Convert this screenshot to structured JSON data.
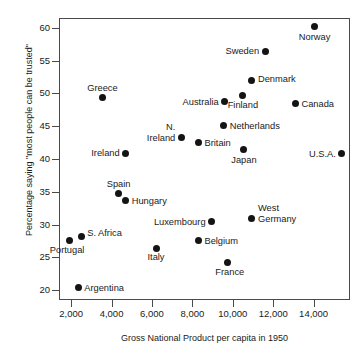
{
  "chart_data": {
    "type": "scatter",
    "title": "",
    "xlabel": "Gross National Product per capita in 1950",
    "ylabel": "Percentage saying \"most people can be trusted\"",
    "xlim": [
      1400,
      15800
    ],
    "ylim": [
      18.5,
      61.5
    ],
    "xticks": [
      "2,000",
      "4,000",
      "6,000",
      "8,000",
      "10,000",
      "12,000",
      "14,000"
    ],
    "xtick_values": [
      2000,
      4000,
      6000,
      8000,
      10000,
      12000,
      14000
    ],
    "yticks": [
      "20",
      "25",
      "30",
      "35",
      "40",
      "45",
      "50",
      "55",
      "60"
    ],
    "ytick_values": [
      20,
      25,
      30,
      35,
      40,
      45,
      50,
      55,
      60
    ],
    "grid": false,
    "legend": "none",
    "marker_color": "#141414",
    "points": [
      {
        "label": "Norway",
        "x": 14050,
        "y": 60.2,
        "pos": "b",
        "dx": 0,
        "dy": 5
      },
      {
        "label": "Sweden",
        "x": 11600,
        "y": 56.4,
        "pos": "l",
        "dx": -6,
        "dy": 0
      },
      {
        "label": "Denmark",
        "x": 10950,
        "y": 52.0,
        "pos": "r",
        "dx": 6,
        "dy": -1
      },
      {
        "label": "Finland",
        "x": 10500,
        "y": 49.7,
        "pos": "b",
        "dx": 0,
        "dy": 5
      },
      {
        "label": "Greece",
        "x": 3550,
        "y": 49.4,
        "pos": "t",
        "dx": 0,
        "dy": -4
      },
      {
        "label": "Australia",
        "x": 9600,
        "y": 48.7,
        "pos": "l",
        "dx": -6,
        "dy": 0
      },
      {
        "label": "Canada",
        "x": 13100,
        "y": 48.4,
        "pos": "r",
        "dx": 6,
        "dy": 0
      },
      {
        "label": "Netherlands",
        "x": 9550,
        "y": 45.1,
        "pos": "r",
        "dx": 6,
        "dy": 0
      },
      {
        "label": "N.\nIreland",
        "x": 7450,
        "y": 43.3,
        "pos": "l",
        "dx": -6,
        "dy": -5
      },
      {
        "label": "Britain",
        "x": 8300,
        "y": 42.5,
        "pos": "r",
        "dx": 6,
        "dy": 0
      },
      {
        "label": "Japan",
        "x": 10550,
        "y": 41.4,
        "pos": "b",
        "dx": 0,
        "dy": 5
      },
      {
        "label": "U.S.A.",
        "x": 15400,
        "y": 40.8,
        "pos": "l",
        "dx": -6,
        "dy": 0
      },
      {
        "label": "Ireland",
        "x": 4700,
        "y": 40.9,
        "pos": "l",
        "dx": -6,
        "dy": 0
      },
      {
        "label": "Spain",
        "x": 4350,
        "y": 34.8,
        "pos": "t",
        "dx": 0,
        "dy": -4
      },
      {
        "label": "Hungary",
        "x": 4700,
        "y": 33.7,
        "pos": "r",
        "dx": 6,
        "dy": 1
      },
      {
        "label": "West\nGermany",
        "x": 10950,
        "y": 31.0,
        "pos": "r",
        "dx": 6,
        "dy": -5
      },
      {
        "label": "Luxembourg",
        "x": 8950,
        "y": 30.4,
        "pos": "l",
        "dx": -6,
        "dy": 0
      },
      {
        "label": "S. Africa",
        "x": 2500,
        "y": 28.2,
        "pos": "r",
        "dx": 6,
        "dy": -3
      },
      {
        "label": "Portugal",
        "x": 1900,
        "y": 27.5,
        "pos": "b",
        "dx": -2,
        "dy": 4
      },
      {
        "label": "Belgium",
        "x": 8300,
        "y": 27.5,
        "pos": "r",
        "dx": 6,
        "dy": 0
      },
      {
        "label": "Italy",
        "x": 6200,
        "y": 26.4,
        "pos": "b",
        "dx": 0,
        "dy": 4
      },
      {
        "label": "France",
        "x": 9750,
        "y": 24.2,
        "pos": "b",
        "dx": 2,
        "dy": 4
      },
      {
        "label": "Argentina",
        "x": 2350,
        "y": 20.4,
        "pos": "r",
        "dx": 6,
        "dy": 0
      }
    ]
  }
}
